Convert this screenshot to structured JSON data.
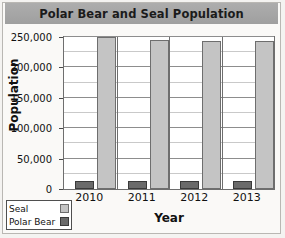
{
  "chart_data": {
    "type": "bar",
    "title": "Polar Bear and Seal Population",
    "xlabel": "Year",
    "ylabel": "Population",
    "categories": [
      "2010",
      "2011",
      "2012",
      "2013"
    ],
    "series": [
      {
        "name": "Polar Bear",
        "values": [
          13000,
          13000,
          14000,
          14000
        ],
        "color": "#6a6a6a"
      },
      {
        "name": "Seal",
        "values": [
          250000,
          245000,
          243000,
          243000
        ],
        "color": "#c4c4c4"
      }
    ],
    "ylim": [
      0,
      250000
    ],
    "ytick_labels": [
      "250,000",
      "200,000",
      "150,000",
      "100,000",
      "50,000",
      "0"
    ],
    "ytick_values": [
      250000,
      200000,
      150000,
      100000,
      50000,
      0
    ],
    "yminor_step": 25000,
    "grid": "horizontal-major-and-minor",
    "legend_position": "bottom-left-outside",
    "legend_entries": [
      "Seal",
      "Polar Bear"
    ]
  },
  "title_banner": {
    "text": "Polar Bear and Seal Population",
    "background_color": "#a8a8a8"
  },
  "axes": {
    "y_title": "Population",
    "x_title": "Year"
  },
  "legend": {
    "rows": [
      {
        "label": "Seal",
        "swatch": "seal-swatch"
      },
      {
        "label": "Polar Bear",
        "swatch": "polar-bear-swatch"
      }
    ]
  }
}
